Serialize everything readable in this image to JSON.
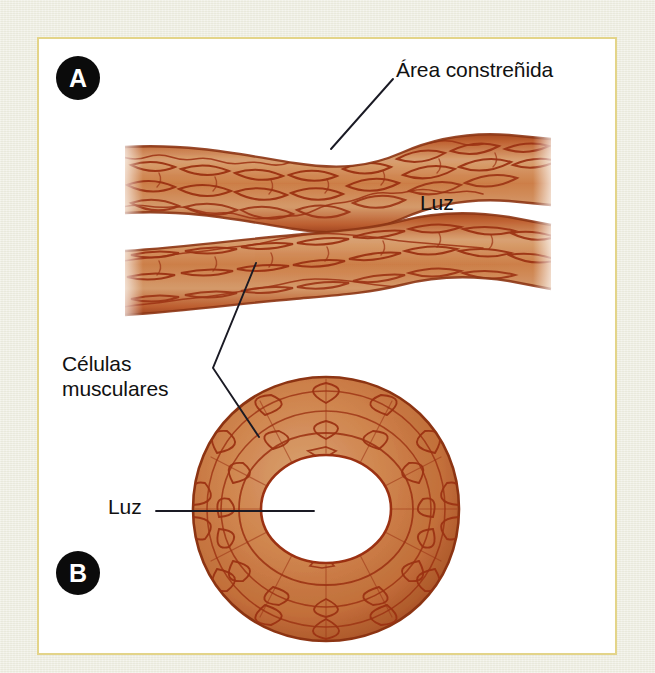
{
  "figure": {
    "title_visible": false,
    "background_color": "#eeeee2",
    "panel_background": "#ffffff",
    "panel_border_color": "#e3d489",
    "tissue_fill_light": "#d9a273",
    "tissue_fill_mid": "#c9763f",
    "tissue_fill_dark": "#a8481f",
    "cell_outline_color": "#9c3314",
    "leader_line_color": "#1a1a24",
    "label_text_color": "#111111",
    "badge_fill": "#0b0b0b",
    "badge_text_color": "#ffffff"
  },
  "panels": [
    {
      "key": "panel-a",
      "badge_label": "A",
      "view": "longitudinal",
      "description_visible": false
    },
    {
      "key": "panel-b",
      "badge_label": "B",
      "view": "cross-section",
      "description_visible": false
    }
  ],
  "labels": {
    "area_constrenida": "Área constreñida",
    "luz_longitudinal": "Luz",
    "celulas_musculares": "Células\nmusculares",
    "luz_cross": "Luz"
  },
  "icons": {
    "badge_a": "circle-letter-a-icon",
    "badge_b": "circle-letter-b-icon",
    "leader_area": "leader-line-icon",
    "leader_celulas": "leader-line-zigzag-icon",
    "leader_luz": "leader-line-horizontal-icon"
  }
}
